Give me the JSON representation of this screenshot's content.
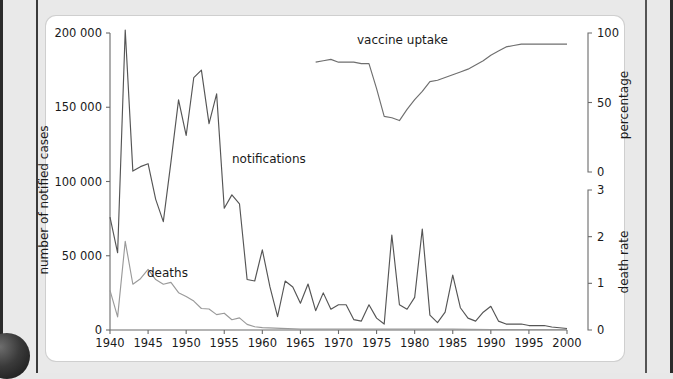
{
  "figure": {
    "background_color": "#e9e9e9",
    "card_color": "#ffffff"
  },
  "labels": {
    "notifications": "notifications",
    "deaths": "deaths",
    "vaccine_uptake": "vaccine uptake",
    "y_left_title": "number of notified cases",
    "y_right_top_title": "percentage",
    "y_right_bottom_title": "death rate"
  },
  "axes": {
    "x_ticks": [
      "1940",
      "1945",
      "1950",
      "1955",
      "1960",
      "1965",
      "1970",
      "1975",
      "1980",
      "1985",
      "1990",
      "1995",
      "2000"
    ],
    "y_left_ticks": [
      "0",
      "50 000",
      "100 000",
      "150 000",
      "200 000"
    ],
    "y_percentage_ticks": [
      "0",
      "50",
      "100"
    ],
    "y_deathrate_ticks": [
      "0",
      "1",
      "2",
      "3"
    ]
  },
  "chart_data": {
    "type": "line",
    "title": "",
    "xlabel": "",
    "ylabel": "number of notified cases",
    "xlim": [
      1940,
      2000
    ],
    "grid": false,
    "legend": "inline-annotations",
    "axes": [
      {
        "name": "number of notified cases",
        "side": "left",
        "range": [
          0,
          200000
        ],
        "ticks": [
          0,
          50000,
          100000,
          150000,
          200000
        ]
      },
      {
        "name": "percentage",
        "side": "right-top",
        "range": [
          0,
          100
        ],
        "ticks": [
          0,
          50,
          100
        ]
      },
      {
        "name": "death rate",
        "side": "right-bottom",
        "range": [
          0,
          3
        ],
        "ticks": [
          0,
          1,
          2,
          3
        ]
      }
    ],
    "series": [
      {
        "name": "notifications",
        "axis": "number of notified cases",
        "color": "#555555",
        "x": [
          1940,
          1941,
          1942,
          1943,
          1944,
          1945,
          1946,
          1947,
          1948,
          1949,
          1950,
          1951,
          1952,
          1953,
          1954,
          1955,
          1956,
          1957,
          1958,
          1959,
          1960,
          1961,
          1962,
          1963,
          1964,
          1965,
          1966,
          1967,
          1968,
          1969,
          1970,
          1971,
          1972,
          1973,
          1974,
          1975,
          1976,
          1977,
          1978,
          1979,
          1980,
          1981,
          1982,
          1983,
          1984,
          1985,
          1986,
          1987,
          1988,
          1989,
          1990,
          1991,
          1992,
          1993,
          1994,
          1995,
          1996,
          1997,
          1998,
          1999,
          2000
        ],
        "values": [
          76000,
          52000,
          202000,
          107000,
          110000,
          112000,
          88000,
          73000,
          113000,
          155000,
          131000,
          170000,
          175000,
          139000,
          159000,
          82000,
          91000,
          85000,
          34000,
          33000,
          54000,
          29000,
          9000,
          33000,
          29000,
          18000,
          31000,
          13000,
          25000,
          14000,
          17000,
          17000,
          7000,
          6000,
          17000,
          8000,
          4000,
          64000,
          17000,
          14000,
          22000,
          68000,
          10000,
          5000,
          12000,
          37000,
          15000,
          8000,
          6000,
          12000,
          16000,
          6000,
          4000,
          4000,
          4000,
          3000,
          3000,
          3000,
          2000,
          1500,
          1000
        ]
      },
      {
        "name": "deaths",
        "axis": "death rate",
        "color": "#9a9a9a",
        "x": [
          1940,
          1941,
          1942,
          1943,
          1944,
          1945,
          1946,
          1947,
          1948,
          1949,
          1950,
          1951,
          1952,
          1953,
          1954,
          1955,
          1956,
          1957,
          1958,
          1959,
          1960,
          1965,
          1970,
          1975,
          1980,
          1985,
          1990,
          1995,
          2000
        ],
        "values": [
          0.85,
          0.28,
          1.9,
          0.98,
          1.1,
          1.3,
          1.08,
          0.98,
          1.02,
          0.8,
          0.72,
          0.62,
          0.46,
          0.45,
          0.33,
          0.36,
          0.22,
          0.26,
          0.12,
          0.07,
          0.05,
          0.02,
          0.02,
          0.02,
          0.02,
          0.02,
          0.01,
          0.01,
          0.01
        ]
      },
      {
        "name": "vaccine uptake",
        "axis": "percentage",
        "color": "#6f6f6f",
        "x": [
          1967,
          1968,
          1969,
          1970,
          1971,
          1972,
          1973,
          1974,
          1975,
          1976,
          1977,
          1978,
          1979,
          1980,
          1981,
          1982,
          1983,
          1984,
          1985,
          1986,
          1987,
          1988,
          1989,
          1990,
          1991,
          1992,
          1993,
          1994,
          1995,
          1996,
          1997,
          1998,
          1999,
          2000
        ],
        "values": [
          79,
          80,
          81,
          79,
          79,
          79,
          78,
          78,
          60,
          40,
          39,
          37,
          45,
          52,
          58,
          65,
          66,
          68,
          70,
          72,
          74,
          77,
          80,
          84,
          87,
          90,
          91,
          92,
          92,
          92,
          92,
          92,
          92,
          92
        ]
      }
    ]
  }
}
